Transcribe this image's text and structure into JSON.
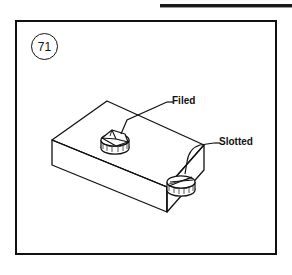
{
  "page": {
    "background_color": "#ffffff",
    "header": {
      "rule_color": "#1a1a1a",
      "ghost_text": "",
      "name": "page-header-rule"
    }
  },
  "figure": {
    "number": "71",
    "frame_color": "#111111",
    "line_color": "#111111",
    "fill_color": "#ffffff",
    "title": "",
    "caption": "",
    "labels": [
      {
        "id": "filed",
        "text": "Filed",
        "description": "Screw head with filed flat surfaces"
      },
      {
        "id": "slotted",
        "text": "Slotted",
        "description": "Screw head with a cut slot"
      }
    ],
    "parts": [
      {
        "id": "block",
        "name": "rectangular-block",
        "text": ""
      },
      {
        "id": "screw-filed",
        "name": "filed-screw-head",
        "text": ""
      },
      {
        "id": "screw-slotted",
        "name": "slotted-screw-head",
        "text": ""
      }
    ]
  }
}
